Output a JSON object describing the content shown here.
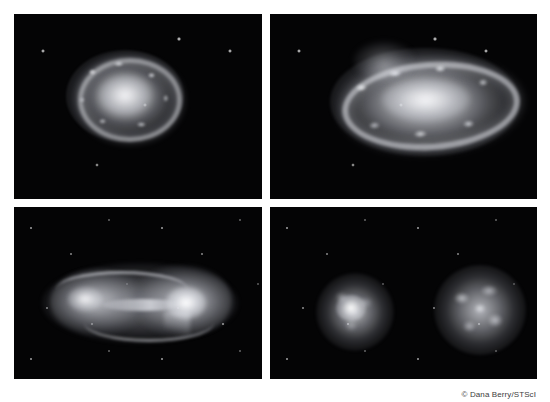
{
  "figure": {
    "layout": "2x2 grid of grayscale astronomical renderings on white background",
    "background_color": "#ffffff",
    "panel_background_color": "#050506",
    "panels": [
      {
        "id": "top-left",
        "name": "panel-top-left",
        "subject": "shell/ring supernova-remnant-like galaxy",
        "description": "Round diffuse glowing sphere with a knotty bright ring and bright central core set in a sparse star field"
      },
      {
        "id": "top-right",
        "name": "panel-top-right",
        "subject": "inclined ring galaxy",
        "description": "Elongated, tilted luminous ring with a bright elliptical core and a faint plume above, on a star field"
      },
      {
        "id": "bottom-left",
        "name": "panel-bottom-left",
        "subject": "interacting galaxy pair with tidal bridge",
        "description": "Dumbbell-shaped merging pair, two nuclei joined by a bright bridge with curved tidal arcs"
      },
      {
        "id": "bottom-right",
        "name": "panel-bottom-right",
        "subject": "two separate round galaxies",
        "description": "Two mottled spherical galaxies, the left smaller with a bright compact core, the right larger and clumpier"
      }
    ]
  },
  "credit": {
    "text": "© Dana Berry/STScI",
    "color": "#3d3d3d"
  }
}
